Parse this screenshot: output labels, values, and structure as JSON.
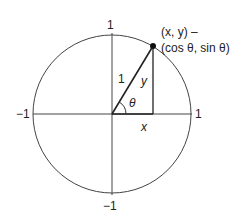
{
  "diagram": {
    "axis_labels": {
      "top": "1",
      "bottom": "−1",
      "left": "−1",
      "right": "1"
    },
    "hypotenuse_label": "1",
    "angle_label": "θ",
    "opposite_label": "y",
    "adjacent_label": "x",
    "point_label_line1": "(x, y) –",
    "point_label_line2": "(cos θ, sin θ)",
    "colors": {
      "stroke": "#333333",
      "text": "#222222",
      "background": "#ffffff"
    }
  }
}
